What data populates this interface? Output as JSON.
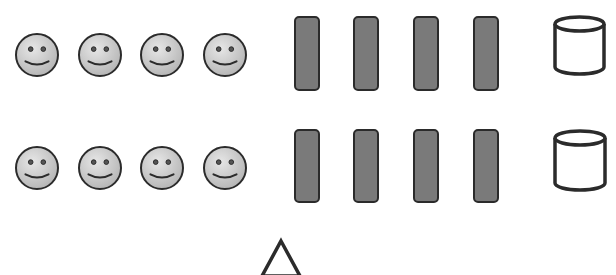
{
  "colors": {
    "background": "#ffffff",
    "outline": "#2b2b2b",
    "smiley_fill_light": "#e6e6e6",
    "smiley_fill_dark": "#b4b4b4",
    "bar_fill": "#7a7a7a",
    "cylinder_fill": "#ffffff",
    "triangle_fill": "#ffffff"
  },
  "rows": [
    {
      "id": "row-1",
      "smileys": [
        {
          "cx": 37,
          "cy": 55,
          "r": 21
        },
        {
          "cx": 100,
          "cy": 55,
          "r": 21
        },
        {
          "cx": 162,
          "cy": 55,
          "r": 21
        },
        {
          "cx": 225,
          "cy": 55,
          "r": 21
        }
      ],
      "bars": [
        {
          "x": 295,
          "y": 17,
          "w": 24,
          "h": 73
        },
        {
          "x": 354,
          "y": 17,
          "w": 24,
          "h": 73
        },
        {
          "x": 414,
          "y": 17,
          "w": 24,
          "h": 73
        },
        {
          "x": 474,
          "y": 17,
          "w": 24,
          "h": 73
        }
      ],
      "cylinder": {
        "x": 555,
        "y": 17,
        "w": 49,
        "h": 57
      }
    },
    {
      "id": "row-2",
      "smileys": [
        {
          "cx": 37,
          "cy": 168,
          "r": 21
        },
        {
          "cx": 100,
          "cy": 168,
          "r": 21
        },
        {
          "cx": 162,
          "cy": 168,
          "r": 21
        },
        {
          "cx": 225,
          "cy": 168,
          "r": 21
        }
      ],
      "bars": [
        {
          "x": 295,
          "y": 130,
          "w": 24,
          "h": 72
        },
        {
          "x": 354,
          "y": 130,
          "w": 24,
          "h": 72
        },
        {
          "x": 414,
          "y": 130,
          "w": 24,
          "h": 72
        },
        {
          "x": 474,
          "y": 130,
          "w": 24,
          "h": 72
        }
      ],
      "cylinder": {
        "x": 555,
        "y": 131,
        "w": 50,
        "h": 59
      }
    }
  ],
  "triangle": {
    "apex_x": 281,
    "apex_y": 241,
    "base_left_x": 262,
    "base_right_x": 300,
    "base_y": 276
  }
}
